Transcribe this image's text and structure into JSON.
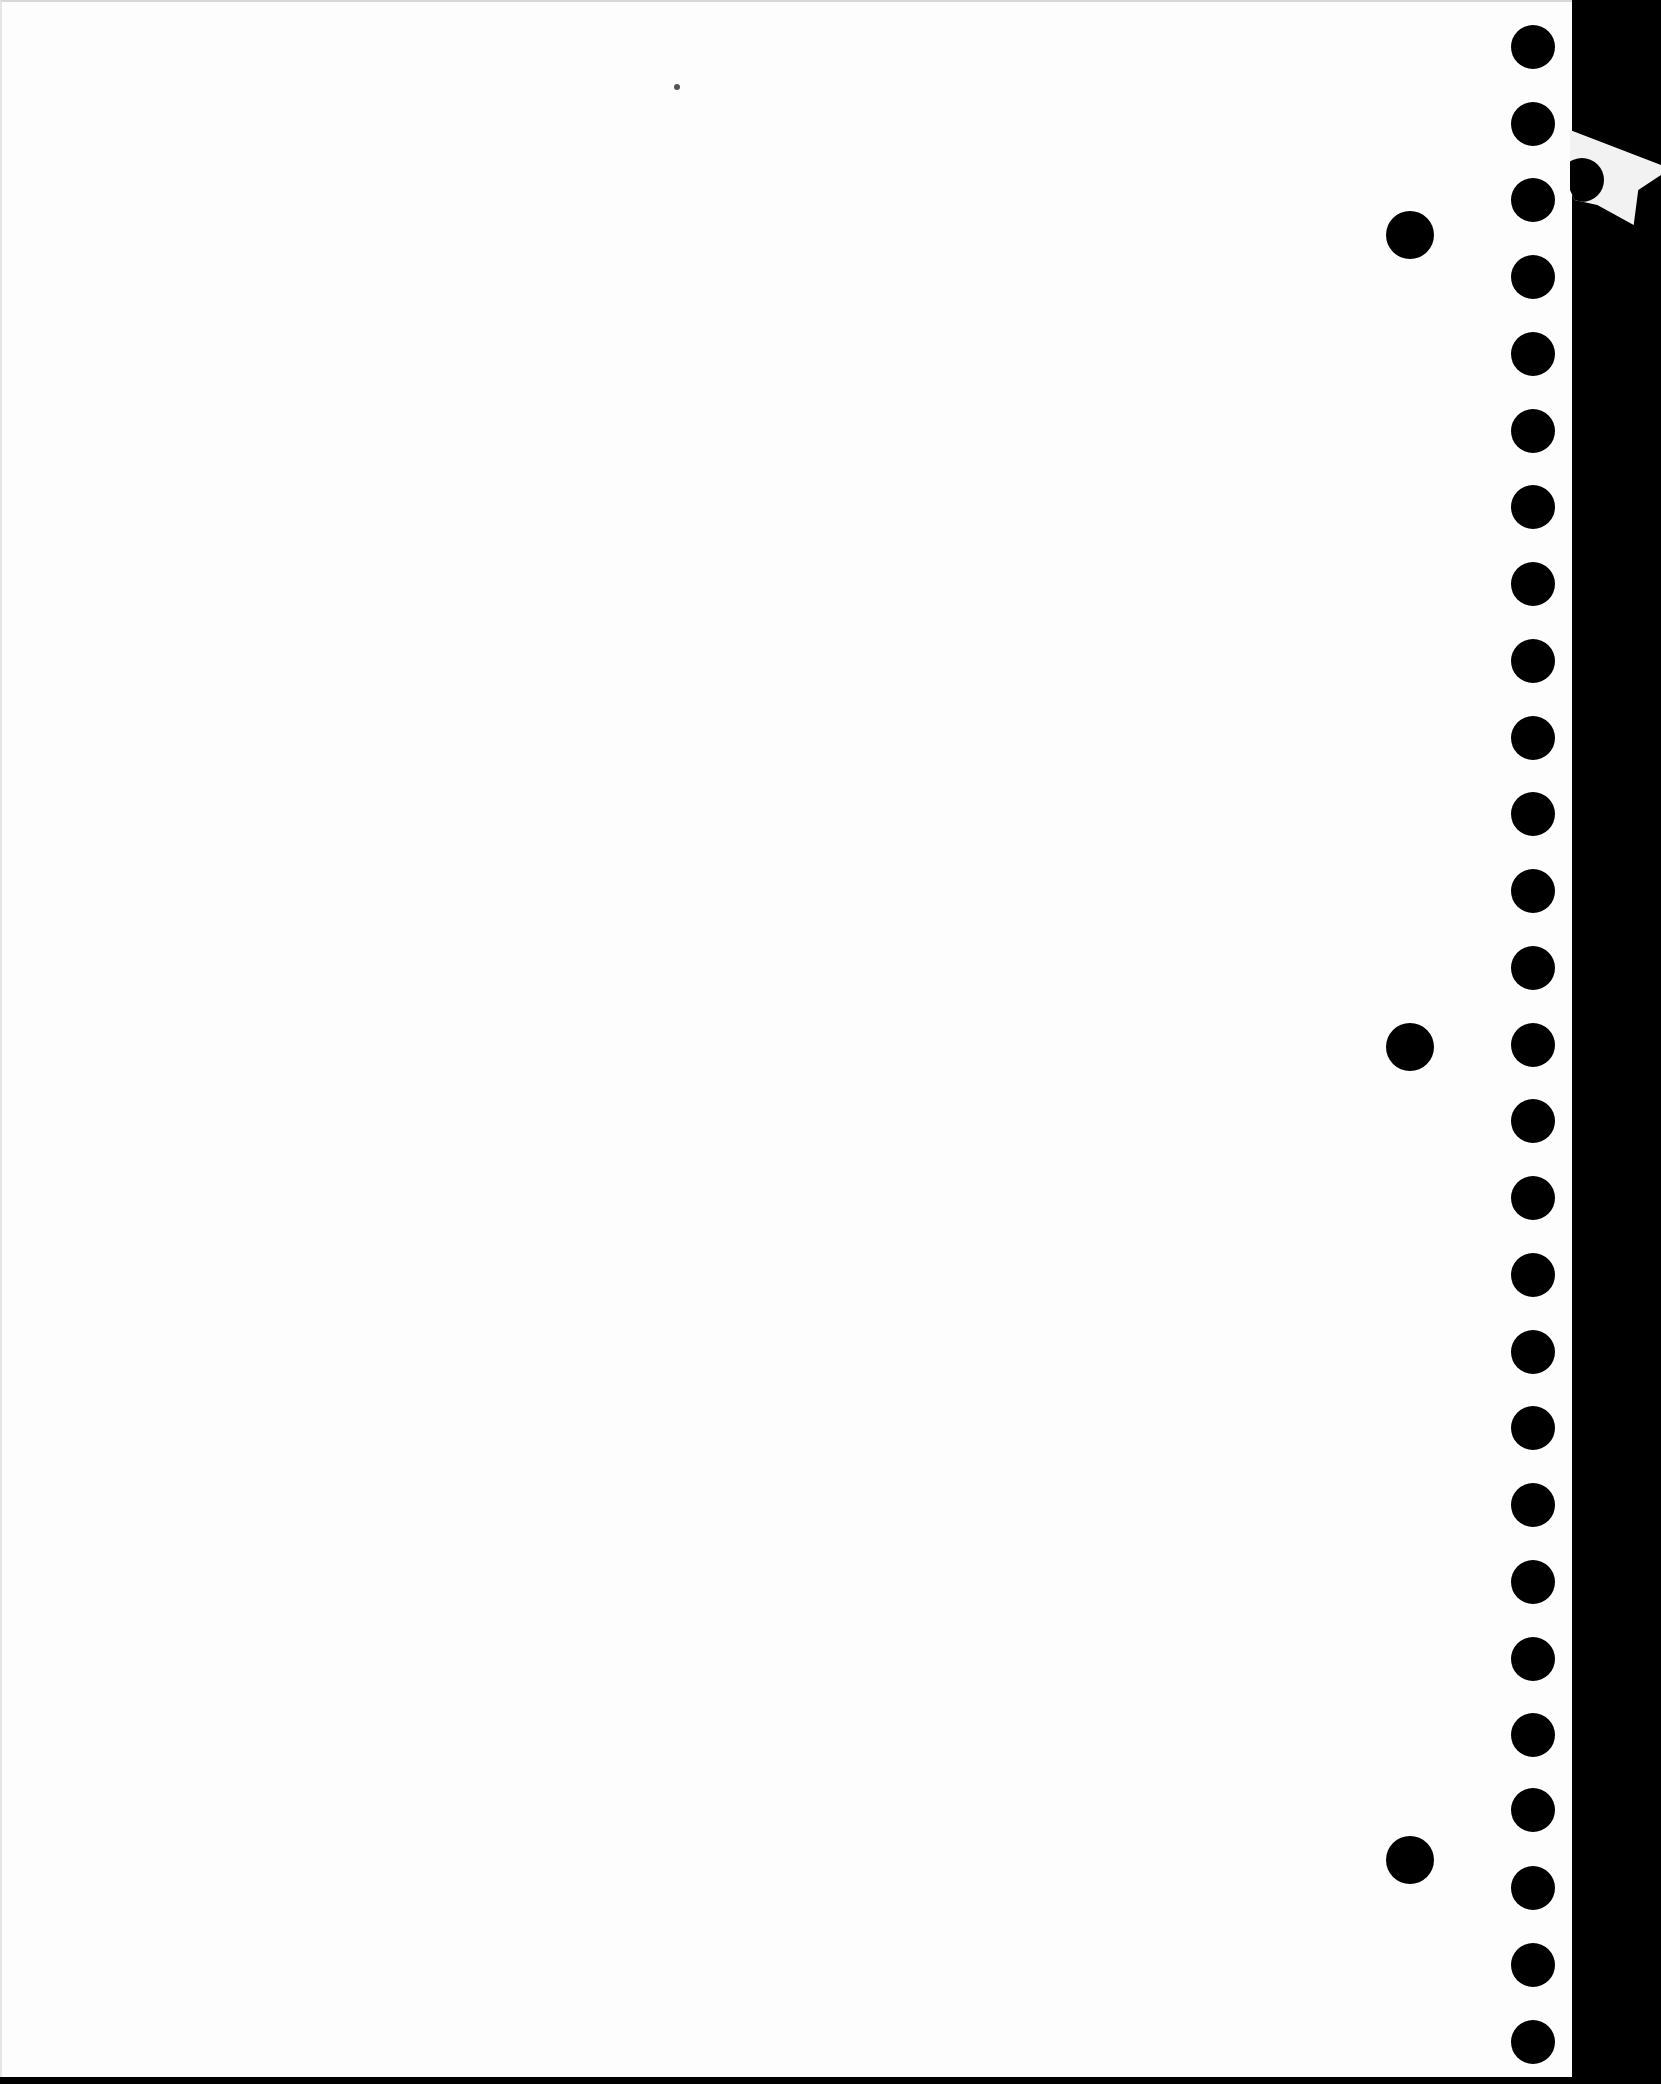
{
  "document": {
    "type": "blank scanned loose-leaf page",
    "background_color": "#fdfdfd",
    "margin_color": "#000000",
    "page_edge_x": 1570,
    "readable_text": []
  },
  "binder_holes": {
    "column_x_center": 1531,
    "small_diameter": 44,
    "small_y_centers": [
      45,
      122,
      198,
      275,
      352,
      429,
      505,
      582,
      659,
      736,
      812,
      889,
      966,
      1043,
      1119,
      1196,
      1273,
      1350,
      1426,
      1503,
      1580,
      1657,
      1733,
      1808,
      1886,
      1963,
      2040
    ],
    "large_x_center": 1408,
    "large_diameter": 48,
    "large_y_centers": [
      233,
      1045,
      1858
    ]
  }
}
